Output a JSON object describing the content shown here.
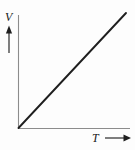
{
  "figure": {
    "name": "volume-versus-temperature-graph",
    "background_color": "#fdfdfd",
    "width": 135,
    "height": 150
  },
  "axes": {
    "y": {
      "label": "V",
      "label_icon": "up-arrow-icon",
      "color": "#8c8c8c",
      "x_px": 18,
      "top_px": 15,
      "bottom_px": 128
    },
    "x": {
      "label": "T",
      "label_icon": "right-arrow-icon",
      "color": "#8c8c8c",
      "y_px": 128,
      "left_px": 18,
      "right_px": 130
    }
  },
  "chart_data": {
    "type": "line",
    "title": "",
    "subtitle": "",
    "xlabel": "T",
    "ylabel": "V",
    "grid": false,
    "legend": null,
    "axis_ticks": {
      "x": [],
      "y": []
    },
    "xlim": [
      0,
      1
    ],
    "ylim": [
      0,
      1
    ],
    "series": [
      {
        "name": "V proportional to T",
        "color": "#1f1f1f",
        "line_width": 1.9,
        "x": [
          0,
          1
        ],
        "values": [
          0,
          1
        ]
      }
    ],
    "annotations": []
  },
  "arrows": {
    "y_arrow": {
      "name": "up-arrow-icon",
      "x_px": 9,
      "tip_y_px": 26,
      "tail_y_px": 53,
      "color": "#1f1f1f"
    },
    "x_arrow": {
      "name": "right-arrow-icon",
      "y_px": 138,
      "tail_x_px": 105,
      "tip_x_px": 130,
      "color": "#1f1f1f"
    }
  }
}
